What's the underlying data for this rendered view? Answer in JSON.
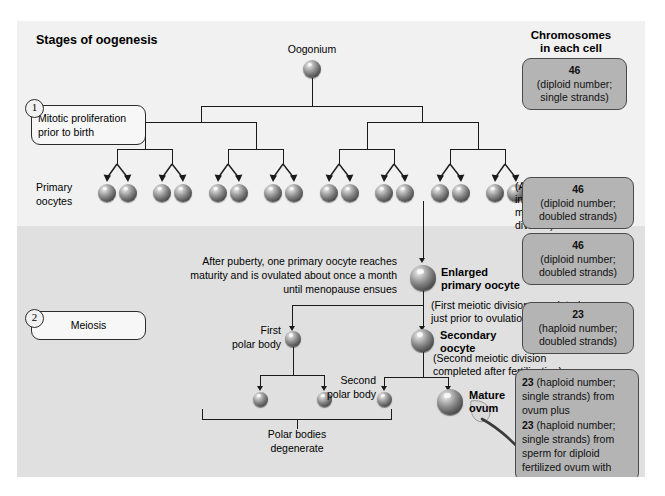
{
  "diagram": {
    "title": "Stages of oogenesis",
    "right_header_line1": "Chromosomes",
    "right_header_line2": "in each cell"
  },
  "stages": [
    {
      "number": "1",
      "label_line1": "Mitotic proliferation",
      "label_line2": "prior to birth"
    },
    {
      "number": "2",
      "label_line1": "Meiosis",
      "label_line2": ""
    }
  ],
  "cell_labels": {
    "oogonium": "Oogonium",
    "primary_oocytes_l1": "Primary",
    "primary_oocytes_l2": "oocytes",
    "enlarged_primary_oocyte_l1": "Enlarged",
    "enlarged_primary_oocyte_l2": "primary oocyte",
    "secondary_oocyte_l1": "Secondary",
    "secondary_oocyte_l2": "oocyte",
    "first_polar_body_l1": "First",
    "first_polar_body_l2": "polar body",
    "second_polar_body_l1": "Second",
    "second_polar_body_l2": "polar body",
    "mature_ovum_l1": "Mature",
    "mature_ovum_l2": "ovum",
    "polar_bodies_degenerate_l1": "Polar bodies",
    "polar_bodies_degenerate_l2": "degenerate"
  },
  "annotations": {
    "arrested_l1": "(Arrested",
    "arrested_l2": "in first",
    "arrested_l3": "meiotic",
    "arrested_l4": "division)",
    "after_puberty_l1": "After puberty, one primary oocyte reaches",
    "after_puberty_l2": "maturity and is ovulated about once a month",
    "after_puberty_l3": "until menopause ensues",
    "first_meiotic_l1": "(First meiotic division completed",
    "first_meiotic_l2": "just prior to ovulation)",
    "second_meiotic_l1": "(Second meiotic division",
    "second_meiotic_l2": "completed after fertilization)"
  },
  "chromosome_boxes": [
    {
      "count": "46",
      "line1": "(diploid number;",
      "line2": "single strands)"
    },
    {
      "count": "46",
      "line1": "(diploid number;",
      "line2": "doubled strands)"
    },
    {
      "count": "46",
      "line1": "(diploid number;",
      "line2": "doubled strands)"
    },
    {
      "count": "23",
      "line1": "(haploid number;",
      "line2": "doubled strands)"
    }
  ],
  "fertilized_box": {
    "l1_bold": "23",
    "l1_rest": " (haploid number;",
    "l2": "single strands) from",
    "l3": "ovum plus",
    "l4_bold": "23",
    "l4_rest": " (haploid number;",
    "l5": "single strands) from",
    "l6": "sperm for diploid",
    "l7": "fertilized ovum with",
    "l8": "46 chromosomes"
  },
  "counts": {
    "primary_oocyte_cells": 16,
    "polar_body_products": 2
  },
  "colors": {
    "panel_background": "#eeeeee",
    "band_mitosis": "#f1f1f1",
    "band_meiosis": "#e0e0e0",
    "chromosome_box_fill": "#b4b4b4",
    "line": "#1a1a1a"
  }
}
